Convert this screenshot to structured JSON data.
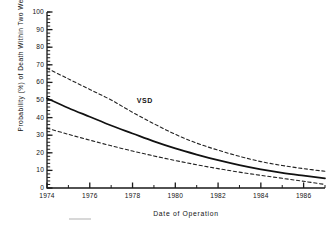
{
  "chart_data": {
    "type": "line",
    "title": "",
    "xlabel": "Date of Operation",
    "ylabel": "Probability (%) of Death Within Two Weeks",
    "xlim": [
      1974,
      1987
    ],
    "ylim": [
      0,
      100
    ],
    "grid": false,
    "legend_position": "inline-annotation",
    "x_ticks": [
      1974,
      1976,
      1978,
      1980,
      1982,
      1984,
      1986
    ],
    "x_tick_labels": [
      "1974",
      "1976",
      "1978",
      "1980",
      "1982",
      "1984",
      "1986"
    ],
    "x_minor_tick_step": 1,
    "y_ticks": [
      0,
      10,
      20,
      30,
      40,
      50,
      60,
      70,
      80,
      90,
      100
    ],
    "y_tick_labels": [
      "0",
      "10",
      "20",
      "30",
      "40",
      "50",
      "60",
      "70",
      "80",
      "90",
      "100"
    ],
    "y_minor_tick_step": 2,
    "annotations": [
      {
        "text": "VSD",
        "x": 1978.2,
        "y": 49.5
      }
    ],
    "x": [
      1974,
      1975,
      1976,
      1977,
      1978,
      1979,
      1980,
      1981,
      1982,
      1983,
      1984,
      1985,
      1986,
      1987
    ],
    "series": [
      {
        "name": "Upper 70% confidence limit",
        "style": "dashed",
        "color": "#222222",
        "values": [
          68.0,
          62.0,
          56.0,
          50.0,
          43.0,
          36.5,
          30.5,
          25.5,
          21.5,
          18.0,
          15.0,
          12.8,
          11.0,
          9.5
        ]
      },
      {
        "name": "VSD",
        "style": "solid",
        "color": "#111111",
        "values": [
          51.0,
          45.5,
          40.5,
          35.5,
          31.0,
          26.5,
          22.5,
          19.0,
          15.8,
          13.0,
          10.6,
          8.6,
          7.0,
          5.5
        ]
      },
      {
        "name": "Lower 70% confidence limit",
        "style": "dashed",
        "color": "#222222",
        "values": [
          34.0,
          30.5,
          27.2,
          24.0,
          21.0,
          18.2,
          15.6,
          13.2,
          11.0,
          9.0,
          7.2,
          5.5,
          3.8,
          2.0
        ]
      }
    ]
  },
  "figure": {
    "background_color": "#ffffff",
    "axis_color": "#1a1a1a"
  }
}
